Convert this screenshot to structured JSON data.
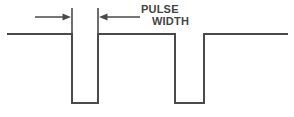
{
  "figure": {
    "name": "pulse-width-waveform-diagram",
    "annotation": {
      "line1": "PULSE",
      "line2": "WIDTH"
    },
    "colors": {
      "stroke": "#4a4a4a",
      "text": "#444444",
      "background": "#ffffff"
    }
  },
  "chart_data": {
    "type": "line",
    "title": "",
    "xlabel": "",
    "ylabel": "",
    "grid": false,
    "legend": null,
    "xlim": [
      0,
      294
    ],
    "ylim": [
      117,
      0
    ],
    "annotations": [
      {
        "text": "PULSE WIDTH",
        "type": "dimension-label",
        "x": 141,
        "y": 16,
        "measures_from_x": 72,
        "measures_to_x": 98
      }
    ],
    "series": [
      {
        "name": "pulse-train",
        "description": "Digital waveform at logic high baseline with two negative-going pulses",
        "points": [
          [
            8,
            34
          ],
          [
            72,
            34
          ],
          [
            72,
            103
          ],
          [
            98,
            103
          ],
          [
            98,
            34
          ],
          [
            175,
            34
          ],
          [
            175,
            103
          ],
          [
            204,
            103
          ],
          [
            204,
            34
          ],
          [
            287,
            34
          ]
        ]
      }
    ],
    "dimension_ticks": [
      {
        "x": 72,
        "y_top": 8,
        "y_bottom": 34
      },
      {
        "x": 98,
        "y_top": 8,
        "y_bottom": 34
      }
    ],
    "dimension_arrows": [
      {
        "name": "left-arrow",
        "from_x": 35,
        "to_x": 71,
        "y": 17,
        "direction": "right"
      },
      {
        "name": "right-arrow",
        "from_x": 140,
        "to_x": 99,
        "y": 17,
        "direction": "left"
      }
    ]
  }
}
